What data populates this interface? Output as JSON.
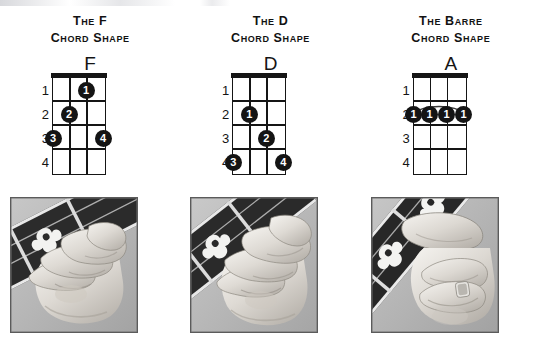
{
  "page": {
    "background_color": "#ffffff",
    "ink_color": "#141414",
    "width": 541,
    "height": 350
  },
  "columns": [
    {
      "id": "f-chord",
      "heading_line1": "The F",
      "heading_line2": "Chord Shape",
      "chord_letter": "F",
      "fret_numbers": [
        "1",
        "2",
        "3",
        "4"
      ],
      "strings": 4,
      "frets": 4,
      "has_nut": true,
      "barre": null,
      "dots": [
        {
          "finger": "1",
          "string": 3,
          "fret": 1
        },
        {
          "finger": "2",
          "string": 2,
          "fret": 2
        },
        {
          "finger": "3",
          "string": 1,
          "fret": 3
        },
        {
          "finger": "4",
          "string": 4,
          "fret": 3
        }
      ],
      "photo_alt": "Left hand fingering the F chord shape on a banjo neck"
    },
    {
      "id": "d-chord",
      "heading_line1": "The D",
      "heading_line2": "Chord Shape",
      "chord_letter": "D",
      "fret_numbers": [
        "1",
        "2",
        "3",
        "4"
      ],
      "strings": 4,
      "frets": 4,
      "has_nut": true,
      "barre": null,
      "dots": [
        {
          "finger": "1",
          "string": 2,
          "fret": 2
        },
        {
          "finger": "2",
          "string": 3,
          "fret": 3
        },
        {
          "finger": "3",
          "string": 1,
          "fret": 4
        },
        {
          "finger": "4",
          "string": 4,
          "fret": 4
        }
      ],
      "photo_alt": "Left hand fingering the D chord shape on a banjo neck"
    },
    {
      "id": "barre-chord",
      "heading_line1": "The Barre",
      "heading_line2": "Chord Shape",
      "chord_letter": "A",
      "fret_numbers": [
        "1",
        "2",
        "3",
        "4"
      ],
      "strings": 4,
      "frets": 4,
      "has_nut": true,
      "barre": {
        "fret": 2,
        "from_string": 1,
        "to_string": 4,
        "finger": "1"
      },
      "dots": [
        {
          "finger": "1",
          "string": 1,
          "fret": 2
        },
        {
          "finger": "1",
          "string": 2,
          "fret": 2
        },
        {
          "finger": "1",
          "string": 3,
          "fret": 2
        },
        {
          "finger": "1",
          "string": 4,
          "fret": 2
        }
      ],
      "photo_alt": "Left hand index finger barring all strings on a banjo neck"
    }
  ]
}
